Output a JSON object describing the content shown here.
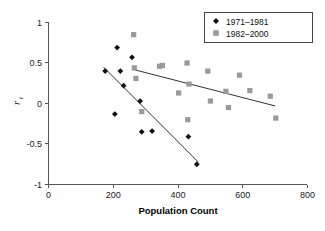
{
  "chart_data": {
    "type": "scatter",
    "title": "",
    "xlabel": "Population Count",
    "ylabel": "r",
    "ylabel_subscript": "t",
    "xlim": [
      0,
      800
    ],
    "ylim": [
      -1,
      1
    ],
    "xticks": [
      0,
      200,
      400,
      600,
      800
    ],
    "yticks": [
      1,
      0.5,
      0,
      -0.5,
      -1
    ],
    "xtick_labels": [
      "0",
      "200",
      "400",
      "600",
      "800"
    ],
    "ytick_labels": [
      "1",
      "0.5",
      "0",
      "-0.5",
      "-1"
    ],
    "grid": false,
    "legend_position": "top-right",
    "series": [
      {
        "name": "1971–1981",
        "marker": "diamond",
        "color": "#111111",
        "points": [
          [
            175,
            0.4
          ],
          [
            205,
            -0.13
          ],
          [
            212,
            0.69
          ],
          [
            222,
            0.4
          ],
          [
            232,
            0.22
          ],
          [
            258,
            0.57
          ],
          [
            283,
            0.03
          ],
          [
            288,
            -0.35
          ],
          [
            320,
            -0.34
          ],
          [
            432,
            -0.41
          ],
          [
            458,
            -0.75
          ]
        ],
        "trendline": {
          "x1": 170,
          "y1": 0.45,
          "x2": 462,
          "y2": -0.72
        }
      },
      {
        "name": "1982–2000",
        "marker": "square",
        "color": "#999999",
        "points": [
          [
            263,
            0.85
          ],
          [
            265,
            0.44
          ],
          [
            270,
            0.31
          ],
          [
            288,
            -0.1
          ],
          [
            343,
            0.46
          ],
          [
            352,
            0.47
          ],
          [
            402,
            0.13
          ],
          [
            428,
            0.5
          ],
          [
            430,
            -0.2
          ],
          [
            434,
            0.24
          ],
          [
            492,
            0.4
          ],
          [
            500,
            0.03
          ],
          [
            548,
            0.15
          ],
          [
            556,
            -0.05
          ],
          [
            590,
            0.35
          ],
          [
            622,
            0.16
          ],
          [
            685,
            0.09
          ],
          [
            702,
            -0.18
          ]
        ],
        "trendline": {
          "x1": 262,
          "y1": 0.42,
          "x2": 700,
          "y2": -0.03
        }
      }
    ]
  },
  "legend": {
    "entries": [
      {
        "label": "1971–1981",
        "marker": "diamond",
        "color": "#111111"
      },
      {
        "label": "1982–2000",
        "marker": "square",
        "color": "#999999"
      }
    ]
  },
  "axes": {
    "x_title": "Population Count",
    "y_title": "r",
    "y_title_sub": "t"
  }
}
